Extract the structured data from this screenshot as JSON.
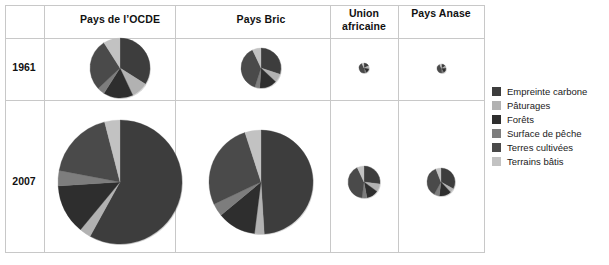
{
  "table": {
    "row_headers": [
      "1961",
      "2007"
    ],
    "column_headers": [
      "Pays de l’OCDE",
      "Pays Bric",
      "Union africaine",
      "Pays Anase"
    ]
  },
  "legend": {
    "items": [
      {
        "label": "Empreinte carbone",
        "color": "#3d3d3d"
      },
      {
        "label": "Pâturages",
        "color": "#b2b2b2"
      },
      {
        "label": "Forêts",
        "color": "#2e2e2e"
      },
      {
        "label": "Surface de pêche",
        "color": "#7d7d7d"
      },
      {
        "label": "Terres cultivées",
        "color": "#4a4a4a"
      },
      {
        "label": "Terrains bâtis",
        "color": "#c2c2c2"
      }
    ]
  },
  "chart_data": {
    "type": "pie",
    "title": "",
    "legend_position": "right",
    "categories": [
      "Empreinte carbone",
      "Pâturages",
      "Forêts",
      "Surface de pêche",
      "Terres cultivées",
      "Terrains bâtis"
    ],
    "colors": [
      "#3d3d3d",
      "#b2b2b2",
      "#2e2e2e",
      "#7d7d7d",
      "#4a4a4a",
      "#c2c2c2"
    ],
    "value_unit": "share of ecological footprint (%)",
    "radius_unit": "px (area proportional to total footprint)",
    "charts": [
      {
        "row": "1961",
        "column": "Pays de l’OCDE",
        "radius": 30,
        "cx": 120,
        "cy": 68,
        "start_angle": -90,
        "values": [
          34,
          9,
          16,
          4,
          28,
          9
        ]
      },
      {
        "row": "1961",
        "column": "Pays Bric",
        "radius": 20,
        "cx": 261,
        "cy": 68,
        "start_angle": -90,
        "values": [
          30,
          7,
          14,
          4,
          38,
          7
        ]
      },
      {
        "row": "1961",
        "column": "Union africaine",
        "radius": 5,
        "cx": 364,
        "cy": 68,
        "start_angle": -90,
        "values": [
          18,
          10,
          14,
          5,
          46,
          7
        ]
      },
      {
        "row": "1961",
        "column": "Pays Anase",
        "radius": 4.5,
        "cx": 441,
        "cy": 68,
        "start_angle": -90,
        "values": [
          16,
          8,
          18,
          7,
          44,
          7
        ]
      },
      {
        "row": "2007",
        "column": "Pays de l’OCDE",
        "radius": 62,
        "cx": 120,
        "cy": 182,
        "start_angle": -90,
        "values": [
          58,
          3,
          13,
          4,
          18,
          4
        ]
      },
      {
        "row": "2007",
        "column": "Pays Bric",
        "radius": 52,
        "cx": 261,
        "cy": 182,
        "start_angle": -90,
        "values": [
          49,
          3,
          12,
          4,
          27,
          5
        ]
      },
      {
        "row": "2007",
        "column": "Union africaine",
        "radius": 16,
        "cx": 364,
        "cy": 182,
        "start_angle": -90,
        "values": [
          27,
          8,
          12,
          5,
          41,
          7
        ]
      },
      {
        "row": "2007",
        "column": "Pays Anase",
        "radius": 14,
        "cx": 441,
        "cy": 182,
        "start_angle": -90,
        "values": [
          33,
          5,
          14,
          6,
          36,
          6
        ]
      }
    ]
  },
  "layout": {
    "frame": {
      "left": 5,
      "top": 5,
      "width": 480,
      "height": 248
    },
    "v_dividers": [
      44,
      175,
      330,
      398
    ],
    "h_dividers": [
      38,
      100
    ],
    "col_centers": [
      24,
      120,
      261,
      364,
      441
    ],
    "row_centers": [
      68,
      182
    ],
    "header_center_y": 20
  }
}
